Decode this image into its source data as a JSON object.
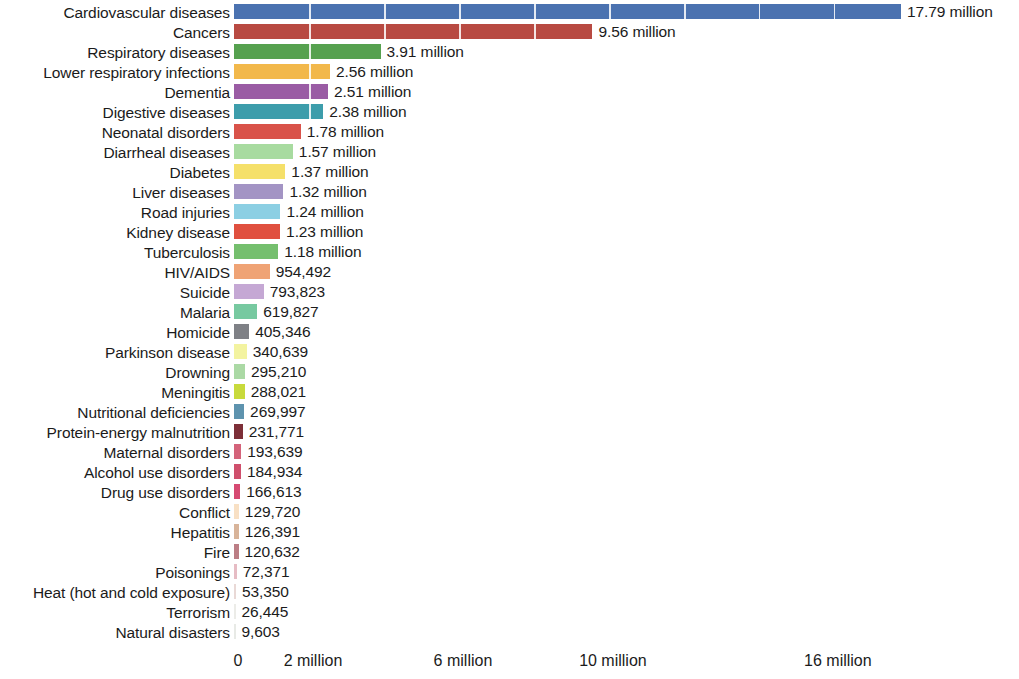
{
  "chart_data": {
    "type": "bar",
    "orientation": "horizontal",
    "title": "",
    "subtitle": "",
    "xlabel": "",
    "ylabel": "",
    "grid": true,
    "gridlines_on_bars": true,
    "legend": "none",
    "xlim": [
      0,
      17.79
    ],
    "x_unit": "deaths",
    "axis_ticks": [
      {
        "label": "0",
        "value": 0
      },
      {
        "label": "2 million",
        "value": 2000000
      },
      {
        "label": "6 million",
        "value": 6000000
      },
      {
        "label": "10 million",
        "value": 10000000
      },
      {
        "label": "16 million",
        "value": 16000000
      }
    ],
    "categories": [
      "Cardiovascular diseases",
      "Cancers",
      "Respiratory diseases",
      "Lower respiratory infections",
      "Dementia",
      "Digestive diseases",
      "Neonatal disorders",
      "Diarrheal diseases",
      "Diabetes",
      "Liver diseases",
      "Road injuries",
      "Kidney disease",
      "Tuberculosis",
      "HIV/AIDS",
      "Suicide",
      "Malaria",
      "Homicide",
      "Parkinson disease",
      "Drowning",
      "Meningitis",
      "Nutritional deficiencies",
      "Protein-energy malnutrition",
      "Maternal disorders",
      "Alcohol use disorders",
      "Drug use disorders",
      "Conflict",
      "Hepatitis",
      "Fire",
      "Poisonings",
      "Heat (hot and cold exposure)",
      "Terrorism",
      "Natural disasters"
    ],
    "values": [
      17790000,
      9560000,
      3910000,
      2560000,
      2510000,
      2380000,
      1780000,
      1570000,
      1370000,
      1320000,
      1240000,
      1230000,
      1180000,
      954492,
      793823,
      619827,
      405346,
      340639,
      295210,
      288021,
      269997,
      231771,
      193639,
      184934,
      166613,
      129720,
      126391,
      120632,
      72371,
      53350,
      26445,
      9603
    ],
    "value_labels": [
      "17.79 million",
      "9.56 million",
      "3.91 million",
      "2.56 million",
      "2.51 million",
      "2.38 million",
      "1.78 million",
      "1.57 million",
      "1.37 million",
      "1.32 million",
      "1.24 million",
      "1.23 million",
      "1.18 million",
      "954,492",
      "793,823",
      "619,827",
      "405,346",
      "340,639",
      "295,210",
      "288,021",
      "269,997",
      "231,771",
      "193,639",
      "184,934",
      "166,613",
      "129,720",
      "126,391",
      "120,632",
      "72,371",
      "53,350",
      "26,445",
      "9,603"
    ],
    "colors": [
      "#4b72b0",
      "#b84a42",
      "#56a14f",
      "#f2b councils",
      "#9a5ca4",
      "#3d9dab",
      "#d9534a",
      "#a8dba0",
      "#f5e06a",
      "#a394c4",
      "#8ccfe3",
      "#e0503f",
      "#75bf6e",
      "#efa375",
      "#c5a8d4",
      "#77c9a0",
      "#7f8186",
      "#f3f3a0",
      "#abd9a5",
      "#c8da3c",
      "#5e93ae",
      "#7d2f38",
      "#d4637a",
      "#cf4f6c",
      "#d64a72",
      "#f8e0c4",
      "#d8b49a",
      "#bc7e85",
      "#e6bcc4",
      "#e9d9d6",
      "#ecece8",
      "#e8eae6"
    ]
  }
}
